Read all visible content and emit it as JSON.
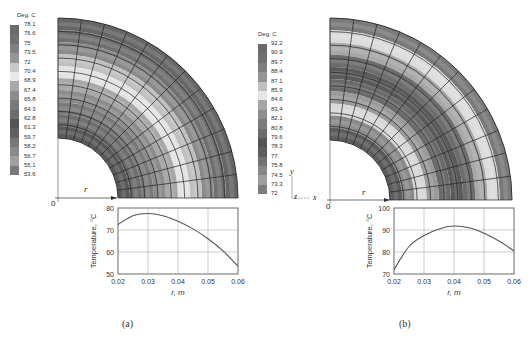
{
  "figure": {
    "panels": [
      {
        "id": "a",
        "caption": "(a)",
        "colorbar": {
          "title": "Deg. C",
          "labels": [
            "78.1",
            "76.6",
            "75",
            "73.5",
            "72",
            "70.4",
            "68.9",
            "67.4",
            "65.8",
            "64.3",
            "62.8",
            "61.3",
            "59.7",
            "58.2",
            "56.7",
            "55.1",
            "53.6"
          ],
          "colors": [
            "#6a6a6a",
            "#707070",
            "#808080",
            "#959595",
            "#c8c8c8",
            "#e8e8e8",
            "#a8a8a8",
            "#8c8c8c",
            "#7a7a7a",
            "#6e6e6e",
            "#555555",
            "#606060",
            "#777777",
            "#8a8a8a",
            "#a0a0a0",
            "#7a7a7a",
            "#5a5a5a"
          ]
        },
        "contour": {
          "origin_label": "0",
          "axis_label": "r",
          "bands": [
            "#5a5a5a",
            "#6e6e6e",
            "#7a7a7a",
            "#8c8c8c",
            "#a8a8a8",
            "#e4e4e4",
            "#c0c0c0",
            "#8a8a8a",
            "#707070",
            "#666666"
          ]
        },
        "plot": {
          "ylabel": "Temperature, °C",
          "xlabel": "r, m",
          "yticks": [
            "80",
            "70",
            "60",
            "50"
          ],
          "xticks": [
            "0.02",
            "0.03",
            "0.04",
            "0.05",
            "0.06"
          ]
        }
      },
      {
        "id": "b",
        "caption": "(b)",
        "colorbar": {
          "title": "Deg. C",
          "labels": [
            "92.2",
            "90.9",
            "89.7",
            "88.4",
            "87.1",
            "85.9",
            "84.6",
            "83.4",
            "82.1",
            "80.8",
            "79.6",
            "78.3",
            "77",
            "75.8",
            "74.5",
            "73.3",
            "72"
          ],
          "colors": [
            "#6a6a6a",
            "#707070",
            "#7e7e7e",
            "#949494",
            "#c0c0c0",
            "#e6e6e6",
            "#a6a6a6",
            "#8e8e8e",
            "#7c7c7c",
            "#6c6c6c",
            "#555555",
            "#5e5e5e",
            "#737373",
            "#878787",
            "#9e9e9e",
            "#7c7c7c",
            "#575757"
          ]
        },
        "contour": {
          "origin_label": "0",
          "axis_label": "r",
          "triad": {
            "y": "y",
            "z": "z",
            "x": "x"
          },
          "bands": [
            "#5c5c5c",
            "#8a8a8a",
            "#d8d8d8",
            "#9a9a9a",
            "#6a6a6a",
            "#5a5a5a",
            "#6c6c6c",
            "#a8a8a8",
            "#dcdcdc",
            "#7a7a7a"
          ]
        },
        "plot": {
          "ylabel": "Temperature, °C",
          "xlabel": "r, m",
          "yticks": [
            "100",
            "90",
            "80",
            "70"
          ],
          "xticks": [
            "0.02",
            "0.03",
            "0.04",
            "0.05",
            "0.06"
          ]
        }
      }
    ]
  },
  "chart_data": [
    {
      "type": "line",
      "title": "(a)",
      "xlabel": "r, m",
      "ylabel": "Temperature, °C",
      "xlim": [
        0.02,
        0.06
      ],
      "ylim": [
        50,
        80
      ],
      "grid": true,
      "x": [
        0.02,
        0.025,
        0.03,
        0.035,
        0.04,
        0.045,
        0.05,
        0.055,
        0.06
      ],
      "series": [
        {
          "name": "Temperature",
          "values": [
            72.5,
            76.5,
            77.5,
            76.5,
            74.0,
            70.5,
            66.0,
            60.5,
            53.6
          ]
        }
      ]
    },
    {
      "type": "line",
      "title": "(b)",
      "xlabel": "r, m",
      "ylabel": "Temperature, °C",
      "xlim": [
        0.02,
        0.06
      ],
      "ylim": [
        70,
        100
      ],
      "grid": true,
      "x": [
        0.02,
        0.025,
        0.03,
        0.035,
        0.04,
        0.045,
        0.05,
        0.055,
        0.06
      ],
      "series": [
        {
          "name": "Temperature",
          "values": [
            72.0,
            82.5,
            87.5,
            90.5,
            91.8,
            91.0,
            88.5,
            85.0,
            80.5
          ]
        }
      ]
    }
  ]
}
